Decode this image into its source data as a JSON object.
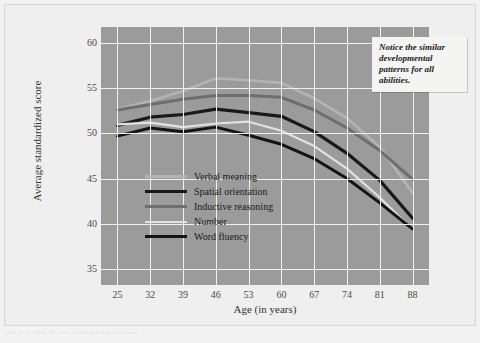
{
  "figure": {
    "annotation_text": "Notice the similar developmental patterns for all abilities.",
    "caption": "Schaie, K. W. (1994). The course of adult intellectual development."
  },
  "chart_data": {
    "type": "line",
    "title": "",
    "xlabel": "Age (in years)",
    "ylabel": "Average standardized score",
    "x": [
      25,
      32,
      39,
      46,
      53,
      60,
      67,
      74,
      81,
      88
    ],
    "xticks": [
      "25",
      "32",
      "39",
      "46",
      "53",
      "60",
      "67",
      "74",
      "81",
      "88"
    ],
    "yticks": [
      "35",
      "40",
      "45",
      "50",
      "55",
      "60"
    ],
    "xlim": [
      21.5,
      91.5
    ],
    "ylim": [
      33.2,
      61.8
    ],
    "grid": true,
    "legend_position": "inside-lower-left",
    "plot_background": "#9b9b9b",
    "grid_color": "#f0f0f0",
    "series": [
      {
        "name": "Verbal meaning",
        "color": "#b4b4b4",
        "width": 2.6,
        "values": [
          52.7,
          53.6,
          54.7,
          56.1,
          55.9,
          55.6,
          53.9,
          51.7,
          48.5,
          43.4
        ]
      },
      {
        "name": "Spatial orientation",
        "color": "#191919",
        "width": 3.2,
        "values": [
          50.9,
          51.8,
          52.1,
          52.7,
          52.3,
          51.9,
          50.2,
          47.8,
          44.8,
          40.6
        ]
      },
      {
        "name": "Inductive reasoning",
        "color": "#6e6e6e",
        "width": 3.0,
        "values": [
          52.6,
          53.2,
          53.8,
          54.2,
          54.2,
          54.0,
          52.6,
          50.6,
          48.1,
          44.9
        ]
      },
      {
        "name": "Number",
        "color": "#e2e2e2",
        "width": 2.2,
        "values": [
          51.0,
          51.2,
          50.7,
          51.1,
          51.3,
          50.3,
          48.6,
          46.1,
          42.9,
          39.3
        ]
      },
      {
        "name": "Word fluency",
        "color": "#141414",
        "width": 3.0,
        "values": [
          49.7,
          50.6,
          50.2,
          50.7,
          49.8,
          48.8,
          47.2,
          45.0,
          42.3,
          39.4
        ]
      }
    ]
  }
}
